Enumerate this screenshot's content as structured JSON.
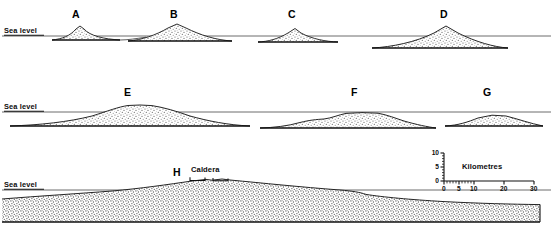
{
  "figure": {
    "type": "cross-section-profiles",
    "width": 553,
    "height": 228,
    "background_color": "#ffffff",
    "ink_color": "#1a1a1a",
    "stipple_fill_color": "#9a9a9a",
    "sea_level_line_color": "#5a5a5a"
  },
  "sea_level_labels": [
    {
      "text": "Sea level",
      "x": 4,
      "y": 27,
      "row": 1
    },
    {
      "text": "Sea level",
      "x": 4,
      "y": 103,
      "row": 2
    },
    {
      "text": "Sea level",
      "x": 4,
      "y": 181,
      "row": 3
    }
  ],
  "sea_level_lines": [
    {
      "row": 1,
      "y": 36,
      "x1": 2,
      "x2": 551
    },
    {
      "row": 2,
      "y": 112,
      "x1": 2,
      "x2": 551
    },
    {
      "row": 3,
      "y": 190,
      "x1": 2,
      "x2": 551
    }
  ],
  "profiles": [
    {
      "id": "A",
      "label": "A",
      "row": 1,
      "label_x": 72,
      "label_y": 10,
      "description": "Small steep seamount, summit just above sea level",
      "summit_x": 80,
      "summit_y": 27,
      "base_left_x": 52,
      "base_right_x": 120,
      "base_y": 40
    },
    {
      "id": "B",
      "label": "B",
      "row": 1,
      "label_x": 170,
      "label_y": 10,
      "description": "Broad low shield, summit above sea level",
      "summit_x": 178,
      "summit_y": 25,
      "base_left_x": 128,
      "base_right_x": 232,
      "base_y": 41
    },
    {
      "id": "C",
      "label": "C",
      "row": 1,
      "label_x": 288,
      "label_y": 10,
      "description": "Low seamount, summit at sea level, flanks below",
      "summit_x": 296,
      "summit_y": 29,
      "base_left_x": 258,
      "base_right_x": 338,
      "base_y": 42
    },
    {
      "id": "D",
      "label": "D",
      "row": 1,
      "label_x": 440,
      "label_y": 10,
      "description": "Large cone with broad submerged apron",
      "summit_x": 447,
      "summit_y": 27,
      "base_left_x": 372,
      "base_right_x": 508,
      "base_y": 48
    },
    {
      "id": "E",
      "label": "E",
      "row": 2,
      "label_x": 124,
      "label_y": 88,
      "description": "Very broad low shield, crest slightly above sea level",
      "summit_x": 132,
      "summit_y": 106,
      "base_left_x": 10,
      "base_right_x": 250,
      "base_y": 126
    },
    {
      "id": "F",
      "label": "F",
      "row": 2,
      "label_x": 351,
      "label_y": 88,
      "description": "Broad flat-topped edifice entirely below sea level",
      "summit_x": 360,
      "summit_y": 112,
      "base_left_x": 260,
      "base_right_x": 436,
      "base_y": 128
    },
    {
      "id": "G",
      "label": "G",
      "row": 2,
      "label_x": 483,
      "label_y": 88,
      "description": "Small flat-lying edifice below sea level",
      "summit_x": 492,
      "summit_y": 114,
      "base_left_x": 445,
      "base_right_x": 543,
      "base_y": 126
    },
    {
      "id": "H",
      "label": "H",
      "row": 3,
      "label_x": 173,
      "label_y": 172,
      "description": "Very large shield volcano spanning full width with summit caldera",
      "summit_x": 220,
      "summit_y": 178,
      "base_left_x": 2,
      "base_right_x": 551,
      "base_y": 222
    }
  ],
  "annotations": {
    "caldera": {
      "label": "Caldera",
      "label_x": 192,
      "label_y": 170,
      "bracket_left_x1": 190,
      "bracket_left_x2": 206,
      "bracket_right_x1": 212,
      "bracket_right_x2": 228,
      "bracket_y": 179
    }
  },
  "scale_inset": {
    "title": "Kilometres",
    "title_x": 462,
    "title_y": 166,
    "origin_x": 444,
    "origin_y": 181,
    "x_axis": {
      "label": "Kilometres",
      "min": 0,
      "max": 30,
      "length_px": 90,
      "major_ticks": [
        0,
        5,
        10,
        20,
        30
      ],
      "major_tick_labels": [
        "0",
        "5",
        "10",
        "20",
        "30"
      ],
      "minor_ticks": [
        1,
        2,
        3,
        4,
        6,
        7,
        8,
        9,
        12,
        14,
        16,
        18,
        22,
        24,
        26,
        28
      ]
    },
    "y_axis": {
      "min": 0,
      "max": 10,
      "length_px": 28,
      "major_ticks": [
        0,
        5,
        10
      ],
      "major_tick_labels": [
        "0",
        "5",
        "10"
      ],
      "minor_ticks": [
        1,
        2,
        3,
        4,
        6,
        7,
        8,
        9
      ]
    }
  }
}
